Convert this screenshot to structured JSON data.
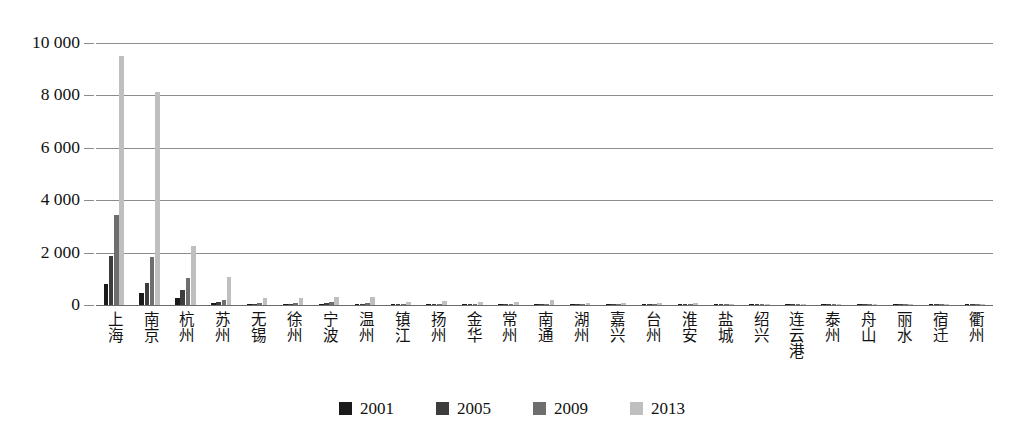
{
  "chart_data": {
    "type": "bar",
    "title": "",
    "subtitle": "",
    "xlabel": "",
    "ylabel": "",
    "ylim": [
      0,
      10000
    ],
    "yticks": [
      0,
      2000,
      4000,
      6000,
      8000,
      10000
    ],
    "ytick_labels": [
      "0",
      "2 000",
      "4 000",
      "6 000",
      "8 000",
      "10 000"
    ],
    "grid": true,
    "legend_position": "bottom",
    "categories": [
      "上海",
      "南京",
      "杭州",
      "苏州",
      "无锡",
      "徐州",
      "宁波",
      "温州",
      "镇江",
      "扬州",
      "金华",
      "常州",
      "南通",
      "湖州",
      "嘉兴",
      "台州",
      "淮安",
      "盐城",
      "绍兴",
      "连云港",
      "泰州",
      "舟山",
      "丽水",
      "宿迁",
      "衢州"
    ],
    "series": [
      {
        "name": "2001",
        "color": "#1a1a1a",
        "values": [
          800,
          460,
          270,
          60,
          20,
          15,
          25,
          20,
          10,
          10,
          10,
          8,
          8,
          6,
          6,
          5,
          5,
          5,
          5,
          4,
          4,
          3,
          3,
          3,
          2
        ]
      },
      {
        "name": "2005",
        "color": "#3d3d3d",
        "values": [
          1870,
          840,
          580,
          120,
          50,
          40,
          60,
          45,
          25,
          20,
          20,
          18,
          16,
          14,
          12,
          12,
          10,
          10,
          10,
          8,
          8,
          6,
          6,
          5,
          4
        ]
      },
      {
        "name": "2009",
        "color": "#6e6e6e",
        "values": [
          3440,
          1830,
          1030,
          210,
          90,
          80,
          110,
          95,
          55,
          45,
          40,
          38,
          35,
          30,
          28,
          25,
          22,
          20,
          20,
          16,
          15,
          12,
          10,
          9,
          7
        ]
      },
      {
        "name": "2013",
        "color": "#bfbfbf",
        "values": [
          9490,
          8140,
          2250,
          1070,
          250,
          270,
          310,
          320,
          130,
          140,
          120,
          110,
          180,
          80,
          75,
          70,
          60,
          55,
          50,
          40,
          38,
          30,
          25,
          22,
          18
        ]
      }
    ]
  },
  "legend": {
    "items": [
      {
        "label": "2001",
        "color": "#1a1a1a"
      },
      {
        "label": "2005",
        "color": "#3d3d3d"
      },
      {
        "label": "2009",
        "color": "#6e6e6e"
      },
      {
        "label": "2013",
        "color": "#bfbfbf"
      }
    ]
  },
  "colors": {
    "background": "#ffffff",
    "gridline": "#8c8c8c",
    "axis": "#6b6b6b",
    "text": "#111111"
  }
}
